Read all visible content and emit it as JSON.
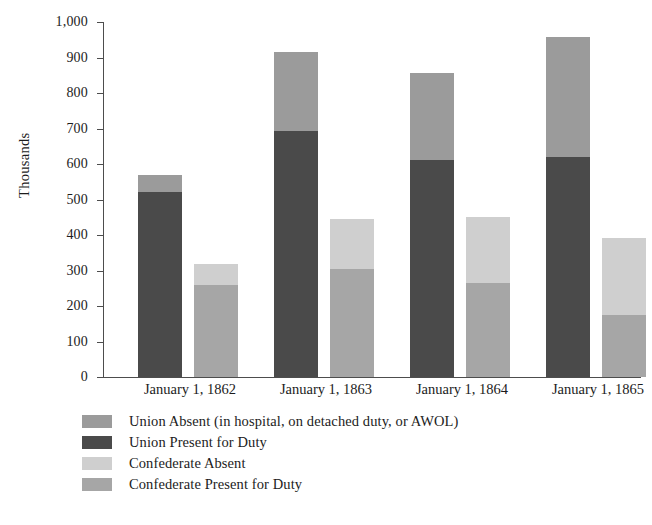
{
  "chart_data": {
    "type": "bar",
    "subtype": "grouped-stacked",
    "title": "",
    "xlabel": "",
    "ylabel": "Thousands",
    "ylim": [
      0,
      1000
    ],
    "yticks": [
      0,
      100,
      200,
      300,
      400,
      500,
      600,
      700,
      800,
      900,
      1000
    ],
    "ytick_labels": [
      "0",
      "100",
      "200",
      "300",
      "400",
      "500",
      "600",
      "700",
      "800",
      "900",
      "1,000"
    ],
    "grid": false,
    "legend_position": "bottom-left",
    "categories": [
      "January 1, 1862",
      "January 1, 1863",
      "January 1, 1864",
      "January 1, 1865"
    ],
    "series": [
      {
        "name": "Union Absent (in hospital, on detached duty, or AWOL)",
        "key": "union_absent",
        "stack": "union",
        "color": "#9b9b9b",
        "values": [
          48,
          222,
          246,
          339
        ]
      },
      {
        "name": "Union Present for Duty",
        "key": "union_present",
        "stack": "union",
        "color": "#4a4a4a",
        "values": [
          520,
          693,
          611,
          620
        ]
      },
      {
        "name": "Confederate Absent",
        "key": "confederate_absent",
        "stack": "confederate",
        "color": "#cfcfcf",
        "values": [
          60,
          142,
          186,
          217
        ]
      },
      {
        "name": "Confederate Present for Duty",
        "key": "confederate_present",
        "stack": "confederate",
        "color": "#a6a6a6",
        "values": [
          258,
          303,
          266,
          175
        ]
      }
    ],
    "stack_totals": {
      "union": [
        568,
        915,
        857,
        959
      ],
      "confederate": [
        318,
        445,
        452,
        392
      ]
    }
  },
  "axis": {
    "y_title": "Thousands",
    "ticks": [
      {
        "value": 1000,
        "label": "1,000"
      },
      {
        "value": 900,
        "label": "900"
      },
      {
        "value": 800,
        "label": "800"
      },
      {
        "value": 700,
        "label": "700"
      },
      {
        "value": 600,
        "label": "600"
      },
      {
        "value": 500,
        "label": "500"
      },
      {
        "value": 400,
        "label": "400"
      },
      {
        "value": 300,
        "label": "300"
      },
      {
        "value": 200,
        "label": "200"
      },
      {
        "value": 100,
        "label": "100"
      },
      {
        "value": 0,
        "label": "0"
      }
    ]
  },
  "groups": [
    {
      "label": "January 1, 1862"
    },
    {
      "label": "January 1, 1863"
    },
    {
      "label": "January 1, 1864"
    },
    {
      "label": "January 1, 1865"
    }
  ],
  "legend": {
    "items": [
      {
        "label": "Union Absent (in hospital, on detached duty, or AWOL)",
        "color": "#9b9b9b"
      },
      {
        "label": "Union Present for Duty",
        "color": "#4a4a4a"
      },
      {
        "label": "Confederate Absent",
        "color": "#cfcfcf"
      },
      {
        "label": "Confederate Present for Duty",
        "color": "#a6a6a6"
      }
    ]
  },
  "colors": {
    "union_absent": "#9b9b9b",
    "union_present": "#4a4a4a",
    "confederate_absent": "#cfcfcf",
    "confederate_present": "#a6a6a6",
    "axis": "#4d4d4d",
    "text": "#1c1c1c",
    "background": "#ffffff"
  }
}
